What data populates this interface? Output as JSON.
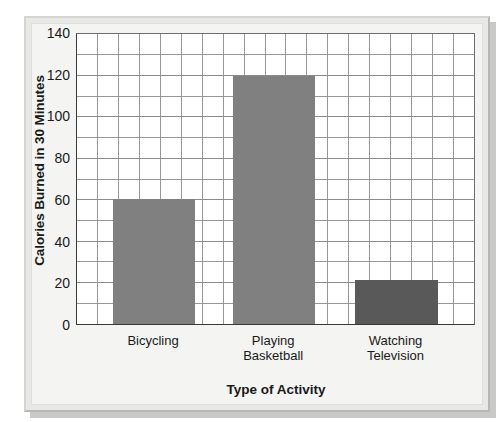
{
  "chart_data": {
    "type": "bar",
    "title": "",
    "subtitle": "",
    "xlabel": "Type of Activity",
    "ylabel": "Calories Burned in 30 Minutes",
    "categories": [
      "Bicycling",
      "Playing Basketball",
      "Watching Television"
    ],
    "category_lines": [
      [
        "Bicycling"
      ],
      [
        "Playing",
        "Basketball"
      ],
      [
        "Watching",
        "Television"
      ]
    ],
    "values": [
      60,
      119,
      21
    ],
    "ylim": [
      0,
      140
    ],
    "y_ticks": [
      0,
      20,
      40,
      60,
      80,
      100,
      120,
      140
    ],
    "y_tick_labels": [
      "0",
      "20",
      "40",
      "60",
      "80",
      "100",
      "120",
      "140"
    ],
    "y_minor_step": 10,
    "x_minor_divisions": 19,
    "grid": true,
    "legend": false,
    "legend_position": "none",
    "bar_colors": [
      "#808080",
      "#808080",
      "#595959"
    ],
    "grid_color": "#8c8c8c",
    "axis_color": "#3a3a3a",
    "plot_background": "#ffffff",
    "figure_background": "#f4f4f2",
    "frame_color": "#e8e8e6"
  }
}
